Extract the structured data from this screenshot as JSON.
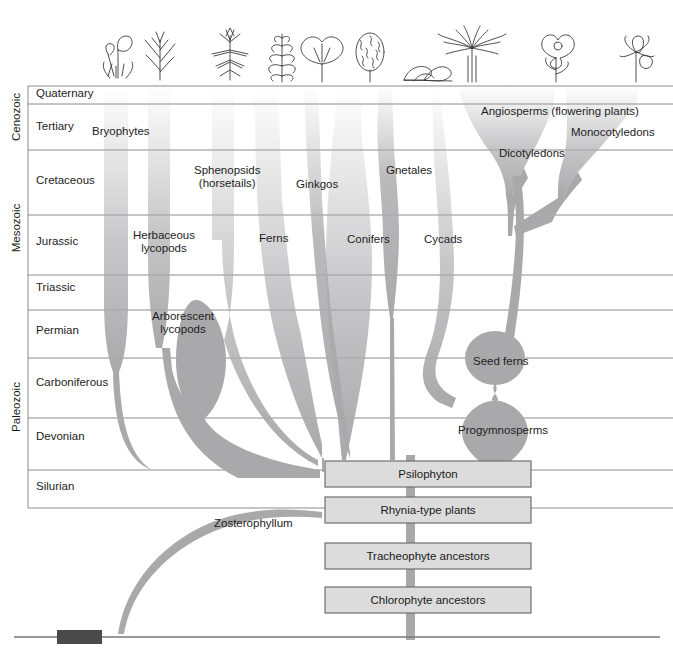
{
  "figure": {
    "type": "phylogeny-spindle-diagram"
  },
  "time_axis": {
    "eras": [
      {
        "name": "Cenozoic",
        "top": 86,
        "bottom": 150
      },
      {
        "name": "Mesozoic",
        "top": 150,
        "bottom": 310
      },
      {
        "name": "Paleozoic",
        "top": 310,
        "bottom": 508
      }
    ],
    "periods": [
      {
        "name": "Quaternary",
        "top": 86,
        "bottom": 104,
        "label_y": 93
      },
      {
        "name": "Tertiary",
        "top": 104,
        "bottom": 150,
        "label_y": 127
      },
      {
        "name": "Cretaceous",
        "top": 150,
        "bottom": 215,
        "label_y": 181
      },
      {
        "name": "Jurassic",
        "top": 215,
        "bottom": 275,
        "label_y": 242
      },
      {
        "name": "Triassic",
        "top": 275,
        "bottom": 310,
        "label_y": 288
      },
      {
        "name": "Permian",
        "top": 310,
        "bottom": 358,
        "label_y": 331
      },
      {
        "name": "Carboniferous",
        "top": 358,
        "bottom": 418,
        "label_y": 383
      },
      {
        "name": "Devonian",
        "top": 418,
        "bottom": 470,
        "label_y": 437
      },
      {
        "name": "Silurian",
        "top": 470,
        "bottom": 508,
        "label_y": 487
      }
    ]
  },
  "clades": [
    {
      "id": "bryophytes",
      "label": "Bryophytes",
      "label_x": 92,
      "label_y": 131,
      "align": "left"
    },
    {
      "id": "herbaceous-lycopods",
      "label": "Herbaceous\nlycopods",
      "label_x": 137,
      "label_y": 236,
      "align": "left"
    },
    {
      "id": "arborescent-lycopods",
      "label": "Arborescent\nlycopods",
      "label_x": 156,
      "label_y": 316,
      "align": "left"
    },
    {
      "id": "sphenopsids",
      "label": "Sphenopsids\n(horsetails)",
      "label_x": 196,
      "label_y": 171,
      "align": "left"
    },
    {
      "id": "ferns",
      "label": "Ferns",
      "label_x": 259,
      "label_y": 238,
      "align": "left"
    },
    {
      "id": "ginkgos",
      "label": "Ginkgos",
      "label_x": 297,
      "label_y": 184,
      "align": "left"
    },
    {
      "id": "conifers",
      "label": "Conifers",
      "label_x": 348,
      "label_y": 240,
      "align": "left"
    },
    {
      "id": "gnetales",
      "label": "Gnetales",
      "label_x": 387,
      "label_y": 170,
      "align": "left"
    },
    {
      "id": "cycads",
      "label": "Cycads",
      "label_x": 424,
      "label_y": 240,
      "align": "left"
    },
    {
      "id": "seed-ferns",
      "label": "Seed ferns",
      "label_x": 476,
      "label_y": 362,
      "align": "left"
    },
    {
      "id": "progymnosperms",
      "label": "Progymnosperms",
      "label_x": 460,
      "label_y": 431,
      "align": "left"
    },
    {
      "id": "angiosperms",
      "label": "Angiosperms (flowering plants)",
      "label_x": 481,
      "label_y": 112,
      "align": "left"
    },
    {
      "id": "monocotyledons",
      "label": "Monocotyledons",
      "label_x": 572,
      "label_y": 133,
      "align": "left"
    },
    {
      "id": "dicotyledons",
      "label": "Dicotyledons",
      "label_x": 500,
      "label_y": 154,
      "align": "left"
    },
    {
      "id": "zosterophyllum",
      "label": "Zosterophyllum",
      "label_x": 216,
      "label_y": 524,
      "align": "left"
    }
  ],
  "ancestor_boxes": [
    {
      "id": "psilophyton",
      "label": "Psilophyton",
      "x": 325,
      "y": 461,
      "w": 206,
      "h": 26
    },
    {
      "id": "rhynia-type-plants",
      "label": "Rhynia-type plants",
      "x": 325,
      "y": 497,
      "w": 206,
      "h": 26
    },
    {
      "id": "tracheophyte-ancestors",
      "label": "Tracheophyte ancestors",
      "x": 325,
      "y": 543,
      "w": 206,
      "h": 26
    },
    {
      "id": "chlorophyte-ancestors",
      "label": "Chlorophyte ancestors",
      "x": 325,
      "y": 587,
      "w": 206,
      "h": 26
    }
  ],
  "plant_icons": [
    {
      "id": "moss-icon",
      "name": "moss-sporophyte-icon",
      "x": 112,
      "y": 22
    },
    {
      "id": "lycopod-icon",
      "name": "lycopod-icon",
      "x": 152,
      "y": 22
    },
    {
      "id": "horsetail-icon",
      "name": "horsetail-icon",
      "x": 222,
      "y": 22
    },
    {
      "id": "fern-icon",
      "name": "fern-frond-icon",
      "x": 275,
      "y": 22
    },
    {
      "id": "ginkgo-icon",
      "name": "ginkgo-leaf-icon",
      "x": 314,
      "y": 34
    },
    {
      "id": "conifer-icon",
      "name": "conifer-cone-icon",
      "x": 362,
      "y": 26
    },
    {
      "id": "gnetales-icon",
      "name": "gnetales-leaf-icon",
      "x": 412,
      "y": 48
    },
    {
      "id": "cycad-icon",
      "name": "cycad-palm-icon",
      "x": 448,
      "y": 22
    },
    {
      "id": "dicot-icon",
      "name": "dicot-flower-icon",
      "x": 540,
      "y": 32
    },
    {
      "id": "monocot-icon",
      "name": "monocot-flower-icon",
      "x": 630,
      "y": 34
    }
  ],
  "colors": {
    "spindle_fill": "#a9a9ac",
    "grid_line": "#8c8c8c",
    "box_fill": "#dcdcdc",
    "box_border": "#6f6f6f",
    "text": "#1a1a1a",
    "footer_marker": "#4a4a4a",
    "footer_rule": "#777777"
  },
  "footer": {
    "rule_y": 637,
    "marker": {
      "x": 57,
      "y": 630,
      "w": 45,
      "h": 14
    }
  }
}
